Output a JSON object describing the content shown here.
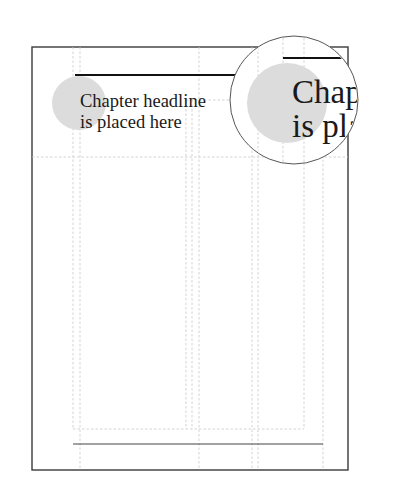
{
  "diagram": {
    "headline": {
      "line1": "Chapter headline",
      "line2": "is placed here"
    },
    "magnifier": {
      "line1": "Chapte",
      "line2": "is place"
    },
    "colors": {
      "page_border": "#3a3a3a",
      "guide": "#c8c8c8",
      "rule": "#111111",
      "marker_circle": "#dcdcdc",
      "text": "#1a1a1a"
    }
  }
}
